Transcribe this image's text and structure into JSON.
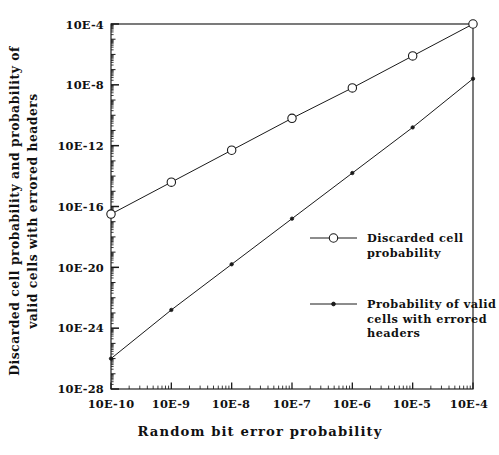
{
  "chart_data": {
    "type": "line",
    "title": "",
    "xlabel": "Random bit error probability",
    "ylabel": "Discarded cell probability and probability of valid cells with errored headers",
    "ylabel_line1": "Discarded cell probability and probability of",
    "ylabel_line2": "valid cells with errored headers",
    "xscale": "log",
    "yscale": "log",
    "x_tick_labels": [
      "10E-10",
      "10E-9",
      "10E-8",
      "10E-7",
      "10E-6",
      "10E-5",
      "10E-4"
    ],
    "x_tick_exponents": [
      -10,
      -9,
      -8,
      -7,
      -6,
      -5,
      -4
    ],
    "y_tick_labels": [
      "10E-4",
      "10E-8",
      "10E-12",
      "10E-16",
      "10E-20",
      "10E-24",
      "10E-28"
    ],
    "y_tick_exponents": [
      -4,
      -8,
      -12,
      -16,
      -20,
      -24,
      -28
    ],
    "xlim": [
      -10,
      -4
    ],
    "ylim": [
      -28,
      -4
    ],
    "grid": false,
    "legend_position": "right-center",
    "series": [
      {
        "name": "Discarded cell probability",
        "marker": "open-circle",
        "x": [
          -10,
          -9,
          -8,
          -7,
          -6,
          -5,
          -4
        ],
        "y_exponents": [
          -16.5,
          -14.4,
          -12.3,
          -10.2,
          -8.2,
          -6.1,
          -4.0
        ],
        "values": [
          "3.2E-17",
          "4.0E-15",
          "5.0E-13",
          "6.3E-11",
          "6.3E-9",
          "7.9E-7",
          "1.0E-4"
        ]
      },
      {
        "name": "Probability of valid cells with errored headers",
        "marker": "filled-dot",
        "x": [
          -10,
          -9,
          -8,
          -7,
          -6,
          -5,
          -4
        ],
        "y_exponents": [
          -26.0,
          -22.8,
          -19.8,
          -16.8,
          -13.8,
          -10.8,
          -7.6
        ],
        "values": [
          "1.0E-26",
          "1.6E-23",
          "1.6E-20",
          "1.6E-17",
          "1.6E-14",
          "1.6E-11",
          "2.5E-8"
        ]
      }
    ]
  },
  "legend": {
    "entries": [
      {
        "label_line1": "Discarded cell",
        "label_line2": "probability",
        "label_line3": "",
        "marker": "open-circle"
      },
      {
        "label_line1": "Probability of valid",
        "label_line2": "cells with errored",
        "label_line3": "headers",
        "marker": "filled-dot"
      }
    ]
  },
  "colors": {
    "line": "#1a1a1a",
    "axis": "#1a1a1a",
    "background": "#ffffff",
    "marker_fill": "#ffffff"
  }
}
